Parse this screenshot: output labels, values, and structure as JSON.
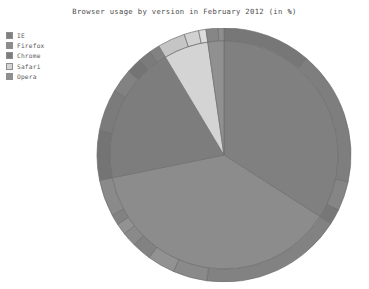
{
  "chart_data": {
    "type": "pie",
    "title": "Browser usage by version in February 2012 (in %)",
    "xlabel": "",
    "ylabel": "",
    "legend_position": "top-left",
    "grid": false,
    "start_angle_deg": 90,
    "direction": "clockwise",
    "categories": [
      "IE",
      "Firefox",
      "Chrome",
      "Safari",
      "Opera"
    ],
    "values": [
      33.0,
      36.5,
      19.0,
      6.1,
      2.2
    ],
    "colors": [
      "#808080",
      "#8c8c8c",
      "#7d7d7d",
      "#d4d4d4",
      "#909090"
    ],
    "series": [
      {
        "name": "Browser",
        "values": [
          33.0,
          36.5,
          19.0,
          6.1,
          2.2
        ]
      },
      {
        "name": "Version",
        "groups": [
          {
            "browser": "IE",
            "labels": [
              "IE 9.0",
              "IE 8.0",
              "IE 7.0",
              "IE 6.0"
            ],
            "values": [
              10.9,
              16.6,
              3.6,
              1.9
            ]
          },
          {
            "browser": "Firefox",
            "labels": [
              "Firefox 10.0",
              "Firefox 9.0",
              "Firefox 8.0",
              "Firefox 7.0",
              "Firefox 6.0",
              "Firefox 5.0",
              "Firefox 4.0",
              "Firefox 3.6"
            ],
            "values": [
              17.5,
              4.2,
              3.4,
              2.4,
              1.8,
              1.4,
              1.3,
              4.5
            ]
          },
          {
            "browser": "Chrome",
            "labels": [
              "Chrome 17.0",
              "Chrome 16.0",
              "Chrome 15.0",
              "Chrome 14.0",
              "Chrome 13.0",
              "Chrome 12.0"
            ],
            "values": [
              6.1,
              5.2,
              2.9,
              1.9,
              1.6,
              1.3
            ]
          },
          {
            "browser": "Safari",
            "labels": [
              "Safari 5.1",
              "Safari 5.0",
              "Safari 4.0"
            ],
            "values": [
              3.4,
              1.8,
              0.9
            ]
          },
          {
            "browser": "Opera",
            "labels": [
              "Opera 11.x",
              "Opera 10.x"
            ],
            "values": [
              1.5,
              0.7
            ]
          }
        ]
      }
    ]
  },
  "legend": {
    "items": [
      {
        "label": "IE",
        "color": "#808080"
      },
      {
        "label": "Firefox",
        "color": "#8c8c8c"
      },
      {
        "label": "Chrome",
        "color": "#7d7d7d"
      },
      {
        "label": "Safari",
        "color": "#d4d4d4"
      },
      {
        "label": "Opera",
        "color": "#909090"
      }
    ]
  }
}
